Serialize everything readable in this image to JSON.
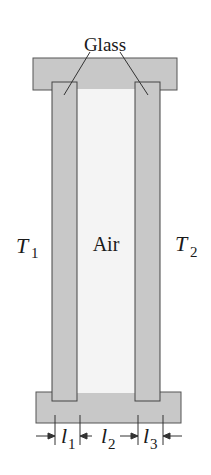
{
  "labels": {
    "glass": "Glass",
    "air": "Air",
    "t1": "T",
    "t1_sub": "1",
    "t2": "T",
    "t2_sub": "2",
    "l1": "l",
    "l1_sub": "1",
    "l2": "l",
    "l2_sub": "2",
    "l3": "l",
    "l3_sub": "3"
  },
  "colors": {
    "frame": "#c8c8c8",
    "glass": "#c8c8c8",
    "air": "#f4f4f4",
    "stroke": "#444444"
  }
}
